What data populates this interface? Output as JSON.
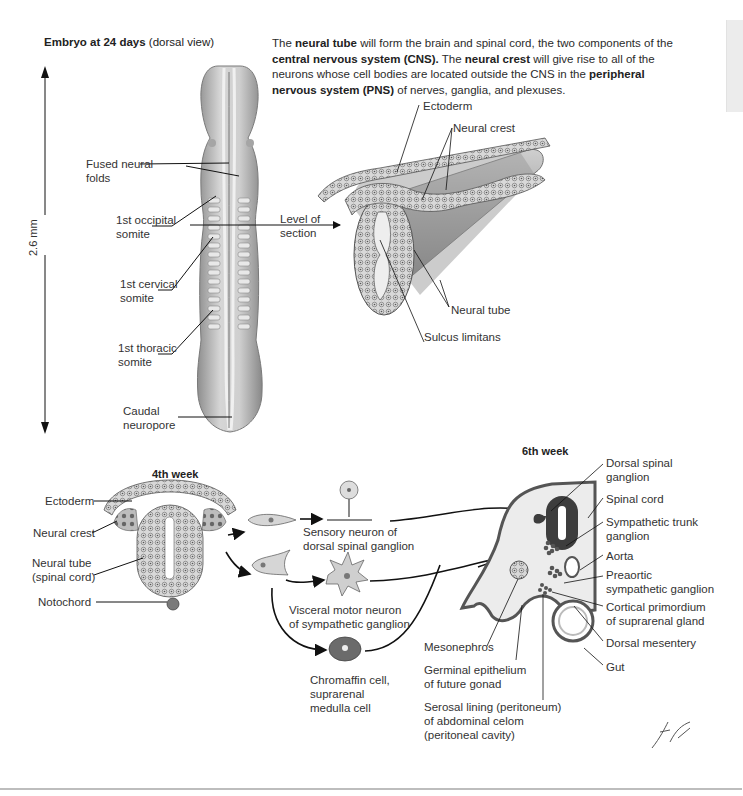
{
  "page": {
    "side_tab": "section-tab",
    "signature": "F. Netter M.D."
  },
  "top_left": {
    "title_bold": "Embryo at 24 days",
    "title_rest": " (dorsal view)",
    "scale": "2.6 mm",
    "labels": {
      "fused_neural_folds_1": "Fused neural",
      "fused_neural_folds_2": "folds",
      "occipital_1": "1st occipital",
      "occipital_2": "somite",
      "cervical_1": "1st cervical",
      "cervical_2": "somite",
      "thoracic_1": "1st thoracic",
      "thoracic_2": "somite",
      "caudal_1": "Caudal",
      "caudal_2": "neuropore",
      "level_1": "Level of",
      "level_2": "section"
    }
  },
  "intro": {
    "p1": "The ",
    "b1": "neural tube",
    "p2": " will form the brain and spinal cord, the two components of the ",
    "b2": "central nervous system (CNS).",
    "p3": " The ",
    "b3": "neural crest",
    "p4": " will give rise to all of the neurons whose cell bodies are located outside the CNS in the ",
    "b4": "peripheral nervous system (PNS)",
    "p5": " of nerves, ganglia, and plexuses."
  },
  "section_view": {
    "labels": {
      "ectoderm": "Ectoderm",
      "neural_crest": "Neural crest",
      "neural_tube": "Neural tube",
      "sulcus_limitans": "Sulcus limitans"
    }
  },
  "week4": {
    "title": "4th week",
    "labels": {
      "ectoderm": "Ectoderm",
      "neural_crest": "Neural crest",
      "neural_tube_1": "Neural tube",
      "neural_tube_2": "(spinal cord)",
      "notochord": "Notochord"
    },
    "derivatives": {
      "sensory_1": "Sensory neuron of",
      "sensory_2": "dorsal spinal ganglion",
      "visceral_1": "Visceral motor neuron",
      "visceral_2": "of sympathetic ganglion",
      "chromaffin_1": "Chromaffin cell,",
      "chromaffin_2": "suprarenal",
      "chromaffin_3": "medulla cell"
    }
  },
  "week6": {
    "title": "6th week",
    "labels": {
      "dorsal_spinal_ganglion_1": "Dorsal spinal",
      "dorsal_spinal_ganglion_2": "ganglion",
      "spinal_cord": "Spinal cord",
      "sympathetic_trunk_1": "Sympathetic trunk",
      "sympathetic_trunk_2": "ganglion",
      "aorta": "Aorta",
      "preaortic_1": "Preaortic",
      "preaortic_2": "sympathetic ganglion",
      "cortical_1": "Cortical primordium",
      "cortical_2": "of suprarenal gland",
      "dorsal_mesentery": "Dorsal mesentery",
      "gut": "Gut",
      "mesonephros": "Mesonephros",
      "germinal_1": "Germinal epithelium",
      "germinal_2": "of future gonad",
      "serosal_1": "Serosal lining (peritoneum)",
      "serosal_2": "of abdominal celom",
      "serosal_3": "(peritoneal cavity)"
    }
  },
  "colors": {
    "embryo_fill": "#b9b9b9",
    "tissue_dark": "#4a4a4a",
    "tissue_light": "#e0e0e0",
    "text": "#2b2b2b"
  }
}
